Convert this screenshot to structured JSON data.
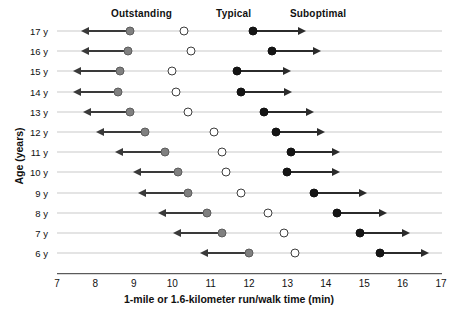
{
  "chart_data": {
    "type": "scatter",
    "title": "",
    "xlabel": "1-mile or 1.6-kilometer run/walk time (min)",
    "ylabel": "Age (years)",
    "xlim": [
      7,
      17
    ],
    "ylim_categories": [
      "17 y",
      "16 y",
      "15 y",
      "14 y",
      "13 y",
      "12 y",
      "11 y",
      "10 y",
      "9 y",
      "8 y",
      "7 y",
      "6 y"
    ],
    "xticks": [
      7,
      8,
      9,
      10,
      11,
      12,
      13,
      14,
      15,
      16,
      17
    ],
    "grid": "horizontal-row-rules",
    "legend_position": "top-inline-headers",
    "legend": [
      {
        "label": "Outstanding",
        "marker": "filled-gray-circle",
        "x": 9.2,
        "color": "#808080"
      },
      {
        "label": "Typical",
        "marker": "open-circle",
        "x": 11.6,
        "color": "#ffffff"
      },
      {
        "label": "Suboptimal",
        "marker": "filled-black-circle",
        "x": 13.8,
        "color": "#151515"
      }
    ],
    "series": [
      {
        "name": "Outstanding",
        "marker": "filled-gray-circle",
        "arrow": "left",
        "values": [
          8.9,
          8.85,
          8.65,
          8.6,
          8.9,
          9.3,
          9.8,
          10.15,
          10.4,
          10.9,
          11.3,
          12.0
        ],
        "arrow_tips": [
          7.8,
          7.8,
          7.6,
          7.6,
          7.85,
          8.2,
          8.7,
          9.15,
          9.3,
          9.8,
          10.2,
          10.9
        ]
      },
      {
        "name": "Typical",
        "marker": "open-circle",
        "arrow": "none",
        "values": [
          10.3,
          10.5,
          10.0,
          10.1,
          10.4,
          11.1,
          11.3,
          11.4,
          11.8,
          12.5,
          12.9,
          13.2
        ],
        "arrow_tips": []
      },
      {
        "name": "Suboptimal",
        "marker": "filled-black-circle",
        "arrow": "right",
        "values": [
          12.1,
          12.6,
          11.7,
          11.8,
          12.4,
          12.7,
          13.1,
          13.0,
          13.7,
          14.3,
          14.9,
          15.4
        ],
        "arrow_tips": [
          13.3,
          13.7,
          12.9,
          12.95,
          13.5,
          13.8,
          14.2,
          14.2,
          14.9,
          15.4,
          16.0,
          16.5
        ]
      }
    ],
    "categories": [
      "17 y",
      "16 y",
      "15 y",
      "14 y",
      "13 y",
      "12 y",
      "11 y",
      "10 y",
      "9 y",
      "8 y",
      "7 y",
      "6 y"
    ]
  },
  "axis": {
    "x_title": "1-mile or 1.6-kilometer run/walk time (min)",
    "y_title": "Age (years)",
    "x_tick_labels": [
      "7",
      "8",
      "9",
      "10",
      "11",
      "12",
      "13",
      "14",
      "15",
      "16",
      "17"
    ],
    "y_tick_labels": [
      "17 y",
      "16 y",
      "15 y",
      "14 y",
      "13 y",
      "12 y",
      "11 y",
      "10 y",
      "9 y",
      "8 y",
      "7 y",
      "6 y"
    ]
  },
  "headers": {
    "outstanding": "Outstanding",
    "typical": "Typical",
    "suboptimal": "Suboptimal"
  },
  "colors": {
    "outstanding": "#808080",
    "typical": "#ffffff",
    "suboptimal": "#151515",
    "rule": "#c9c9c9",
    "axis": "#5a5a5a"
  }
}
